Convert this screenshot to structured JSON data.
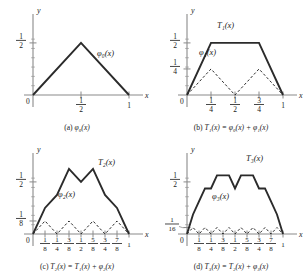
{
  "figure": {
    "title_visible": false,
    "panels": [
      {
        "id": "a",
        "caption_prefix": "(a)",
        "caption_expr": "φ₀(x)",
        "curve_label": "φ₀(x)",
        "dashed_label": "",
        "x_axis_label": "x",
        "y_axis_label": "y",
        "origin_label": "0",
        "y_ticks": [
          {
            "label_num": "1",
            "label_den": "2",
            "value": 0.5
          }
        ],
        "x_ticks": [
          {
            "label_num": "1",
            "label_den": "2",
            "value": 0.5
          },
          {
            "label_num": "1",
            "label_den": "",
            "value": 1.0
          }
        ]
      },
      {
        "id": "b",
        "caption_prefix": "(b)",
        "caption_expr": "T₁(x) = φ₀(x) + φ₁(x)",
        "curve_label": "T₁(x)",
        "dashed_label": "φ₁(x)",
        "x_axis_label": "x",
        "y_axis_label": "y",
        "origin_label": "0",
        "y_ticks": [
          {
            "label_num": "1",
            "label_den": "2",
            "value": 0.5
          },
          {
            "label_num": "1",
            "label_den": "4",
            "value": 0.25
          }
        ],
        "x_ticks": [
          {
            "label_num": "1",
            "label_den": "4",
            "value": 0.25
          },
          {
            "label_num": "1",
            "label_den": "2",
            "value": 0.5
          },
          {
            "label_num": "3",
            "label_den": "4",
            "value": 0.75
          },
          {
            "label_num": "1",
            "label_den": "",
            "value": 1.0
          }
        ]
      },
      {
        "id": "c",
        "caption_prefix": "(c)",
        "caption_expr": "T₂(x) = T₁(x) + φ₂(x)",
        "curve_label": "T₂(x)",
        "dashed_label": "φ₂(x)",
        "x_axis_label": "x",
        "y_axis_label": "y",
        "origin_label": "0",
        "y_ticks": [
          {
            "label_num": "1",
            "label_den": "2",
            "value": 0.5
          },
          {
            "label_num": "1",
            "label_den": "8",
            "value": 0.125
          }
        ],
        "x_ticks": [
          {
            "label_num": "1",
            "label_den": "8",
            "value": 0.125
          },
          {
            "label_num": "1",
            "label_den": "4",
            "value": 0.25
          },
          {
            "label_num": "3",
            "label_den": "8",
            "value": 0.375
          },
          {
            "label_num": "1",
            "label_den": "2",
            "value": 0.5
          },
          {
            "label_num": "5",
            "label_den": "8",
            "value": 0.625
          },
          {
            "label_num": "3",
            "label_den": "4",
            "value": 0.75
          },
          {
            "label_num": "7",
            "label_den": "8",
            "value": 0.875
          },
          {
            "label_num": "1",
            "label_den": "",
            "value": 1.0
          }
        ]
      },
      {
        "id": "d",
        "caption_prefix": "(d)",
        "caption_expr": "T₃(x) = T₂(x) + φ₃(x)",
        "curve_label": "T₃(x)",
        "dashed_label": "φ₃(x)",
        "x_axis_label": "x",
        "y_axis_label": "y",
        "origin_label": "0",
        "y_ticks": [
          {
            "label_num": "1",
            "label_den": "2",
            "value": 0.5
          },
          {
            "label_num": "1",
            "label_den": "16",
            "value": 0.0625
          }
        ],
        "x_ticks": [
          {
            "label_num": "1",
            "label_den": "8",
            "value": 0.125
          },
          {
            "label_num": "1",
            "label_den": "4",
            "value": 0.25
          },
          {
            "label_num": "3",
            "label_den": "8",
            "value": 0.375
          },
          {
            "label_num": "1",
            "label_den": "2",
            "value": 0.5
          },
          {
            "label_num": "5",
            "label_den": "8",
            "value": 0.625
          },
          {
            "label_num": "3",
            "label_den": "4",
            "value": 0.75
          },
          {
            "label_num": "7",
            "label_den": "8",
            "value": 0.875
          },
          {
            "label_num": "1",
            "label_den": "",
            "value": 1.0
          }
        ]
      }
    ]
  },
  "chart_data": [
    {
      "type": "line",
      "panel": "a",
      "title": "(a) φ₀(x)",
      "xlabel": "x",
      "ylabel": "y",
      "xlim": [
        0,
        1.06
      ],
      "ylim": [
        0,
        0.72
      ],
      "grid": false,
      "legend": "inline-labels",
      "series": [
        {
          "name": "φ₀(x)",
          "style": "solid",
          "x": [
            0,
            0.5,
            1
          ],
          "y": [
            0,
            0.5,
            0
          ]
        }
      ]
    },
    {
      "type": "line",
      "panel": "b",
      "title": "(b) T₁(x) = φ₀(x) + φ₁(x)",
      "xlabel": "x",
      "ylabel": "y",
      "xlim": [
        0,
        1.06
      ],
      "ylim": [
        0,
        0.72
      ],
      "grid": false,
      "legend": "inline-labels",
      "series": [
        {
          "name": "T₁(x)",
          "style": "solid",
          "x": [
            0,
            0.25,
            0.75,
            1
          ],
          "y": [
            0,
            0.5,
            0.5,
            0
          ]
        },
        {
          "name": "φ₁(x)",
          "style": "dashed",
          "x": [
            0,
            0.25,
            0.5,
            0.75,
            1
          ],
          "y": [
            0,
            0.25,
            0,
            0.25,
            0
          ]
        }
      ]
    },
    {
      "type": "line",
      "panel": "c",
      "title": "(c) T₂(x) = T₁(x) + φ₂(x)",
      "xlabel": "x",
      "ylabel": "y",
      "xlim": [
        0,
        1.06
      ],
      "ylim": [
        0,
        0.72
      ],
      "grid": false,
      "legend": "inline-labels",
      "series": [
        {
          "name": "T₂(x)",
          "style": "solid",
          "x": [
            0,
            0.125,
            0.25,
            0.375,
            0.5,
            0.625,
            0.75,
            0.875,
            1
          ],
          "y": [
            0,
            0.25,
            0.375,
            0.625,
            0.5,
            0.625,
            0.375,
            0.25,
            0
          ]
        },
        {
          "name": "φ₂(x)",
          "style": "dashed",
          "x": [
            0,
            0.125,
            0.25,
            0.375,
            0.5,
            0.625,
            0.75,
            0.875,
            1
          ],
          "y": [
            0,
            0.125,
            0,
            0.125,
            0,
            0.125,
            0,
            0.125,
            0
          ]
        }
      ]
    },
    {
      "type": "line",
      "panel": "d",
      "title": "(d) T₃(x) = T₂(x) + φ₃(x)",
      "xlabel": "x",
      "ylabel": "y",
      "xlim": [
        0,
        1.06
      ],
      "ylim": [
        0,
        0.72
      ],
      "grid": false,
      "legend": "inline-labels",
      "series": [
        {
          "name": "T₃(x)",
          "style": "solid",
          "x": [
            0,
            0.0625,
            0.125,
            0.1875,
            0.25,
            0.3125,
            0.375,
            0.4375,
            0.5,
            0.5625,
            0.625,
            0.6875,
            0.75,
            0.8125,
            0.875,
            0.9375,
            1
          ],
          "y": [
            0,
            0.1875,
            0.3125,
            0.4375,
            0.4375,
            0.5625,
            0.5625,
            0.5625,
            0.4375,
            0.5625,
            0.5625,
            0.5625,
            0.4375,
            0.4375,
            0.3125,
            0.1875,
            0
          ]
        },
        {
          "name": "φ₃(x)",
          "style": "dashed",
          "x": [
            0,
            0.0625,
            0.125,
            0.1875,
            0.25,
            0.3125,
            0.375,
            0.4375,
            0.5,
            0.5625,
            0.625,
            0.6875,
            0.75,
            0.8125,
            0.875,
            0.9375,
            1
          ],
          "y": [
            0,
            0.0625,
            0,
            0.0625,
            0,
            0.0625,
            0,
            0.0625,
            0,
            0.0625,
            0,
            0.0625,
            0,
            0.0625,
            0,
            0.0625,
            0
          ]
        }
      ]
    }
  ],
  "colors": {
    "curve": "#2b2b2b",
    "axis": "#8a8a8a",
    "text": "#1a1a1a",
    "background": "#ffffff"
  }
}
